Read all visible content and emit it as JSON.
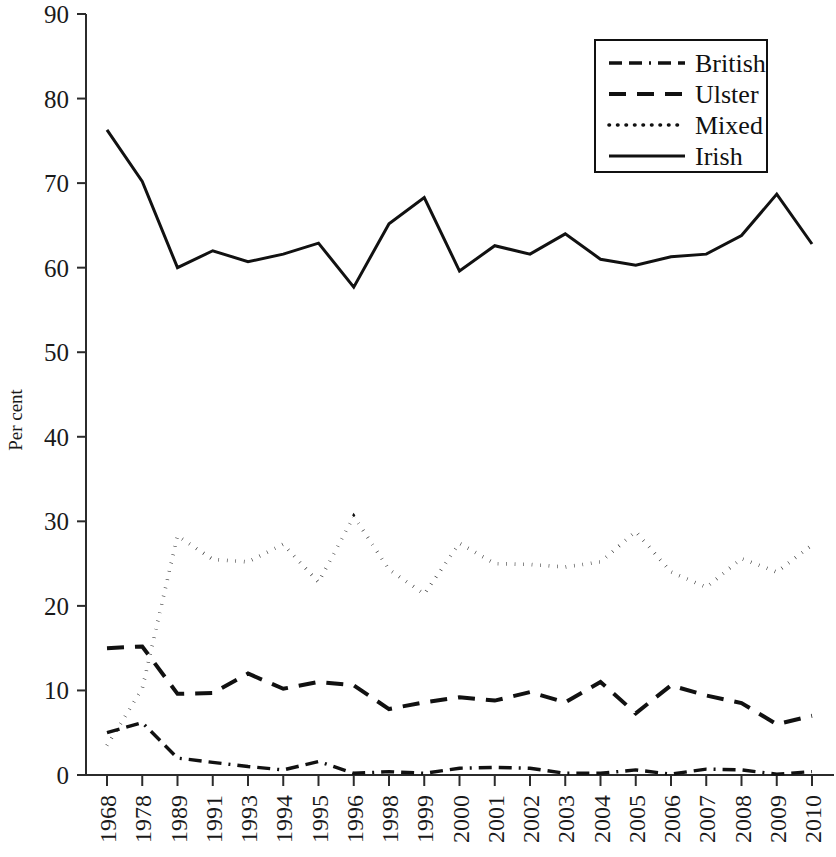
{
  "chart_data": {
    "type": "line",
    "title": "",
    "xlabel": "",
    "ylabel": "Per cent",
    "ylim": [
      0,
      90
    ],
    "ytick_step": 10,
    "grid": false,
    "legend_position": "top-right",
    "categories": [
      "1968",
      "1978",
      "1989",
      "1991",
      "1993",
      "1994",
      "1995",
      "1996",
      "1998",
      "1999",
      "2000",
      "2001",
      "2002",
      "2003",
      "2004",
      "2005",
      "2006",
      "2007",
      "2008",
      "2009",
      "2010"
    ],
    "yticks": [
      "0",
      "10",
      "20",
      "30",
      "40",
      "50",
      "60",
      "70",
      "80",
      "90"
    ],
    "series": [
      {
        "name": "British",
        "style": "dash-dot",
        "values": [
          5.0,
          6.2,
          2.0,
          1.5,
          1.0,
          0.6,
          1.6,
          0.2,
          0.4,
          0.2,
          0.8,
          0.9,
          0.8,
          0.2,
          0.2,
          0.6,
          0.1,
          0.7,
          0.6,
          0.1,
          0.4
        ]
      },
      {
        "name": "Ulster",
        "style": "long-dash",
        "values": [
          15.0,
          15.2,
          9.6,
          9.7,
          12.0,
          10.2,
          11.0,
          10.6,
          7.8,
          8.6,
          9.2,
          8.8,
          9.8,
          8.6,
          11.0,
          7.3,
          10.6,
          9.4,
          8.5,
          6.0,
          7.0
        ]
      },
      {
        "name": "Mixed",
        "style": "dotted",
        "values": [
          3.5,
          10.2,
          28.3,
          25.5,
          25.2,
          27.3,
          22.8,
          30.6,
          24.3,
          21.4,
          27.4,
          25.0,
          24.9,
          24.6,
          25.2,
          28.8,
          24.0,
          22.2,
          25.6,
          24.0,
          27.2
        ]
      },
      {
        "name": "Irish",
        "style": "solid",
        "values": [
          76.3,
          70.2,
          60.0,
          62.0,
          60.7,
          61.6,
          62.9,
          57.7,
          65.2,
          68.3,
          59.6,
          62.6,
          61.6,
          64.0,
          61.0,
          60.3,
          61.3,
          61.6,
          63.8,
          68.7,
          62.8
        ]
      }
    ]
  },
  "legend": {
    "entries": [
      {
        "label": "British",
        "style": "dash-dot"
      },
      {
        "label": "Ulster",
        "style": "long-dash"
      },
      {
        "label": "Mixed",
        "style": "dotted"
      },
      {
        "label": "Irish",
        "style": "solid"
      }
    ]
  },
  "colors": {
    "ink": "#111111",
    "axis": "#2b2b2b",
    "background": "#ffffff"
  }
}
